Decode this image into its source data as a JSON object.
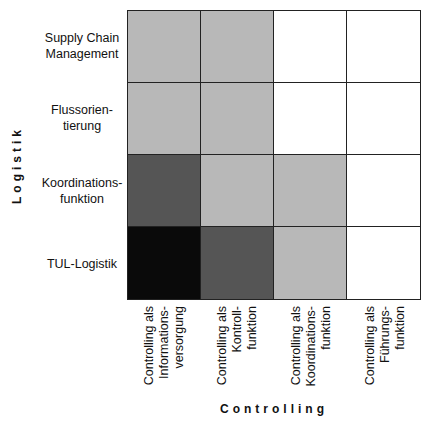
{
  "chart_data": {
    "type": "heatmap",
    "title": "",
    "xlabel": "Controlling",
    "ylabel": "Logistik",
    "rows": [
      "Supply Chain\nManagement",
      "Flussorien-\ntierung",
      "Koordinations-\nfunktion",
      "TUL-Logistik"
    ],
    "columns": [
      "Controlling als\nInformations-\nversorgung",
      "Controlling als\nKontroll-\nfunktion",
      "Controlling als\nKoordinations-\nfunktion",
      "Controlling als\nFührungs-\nfunktion"
    ],
    "cells": [
      [
        "#b8b8b8",
        "#b8b8b8",
        "#ffffff",
        "#ffffff"
      ],
      [
        "#b8b8b8",
        "#b8b8b8",
        "#ffffff",
        "#ffffff"
      ],
      [
        "#555555",
        "#b8b8b8",
        "#b8b8b8",
        "#ffffff"
      ],
      [
        "#0a0a0a",
        "#555555",
        "#b8b8b8",
        "#ffffff"
      ]
    ],
    "legend": "none"
  }
}
